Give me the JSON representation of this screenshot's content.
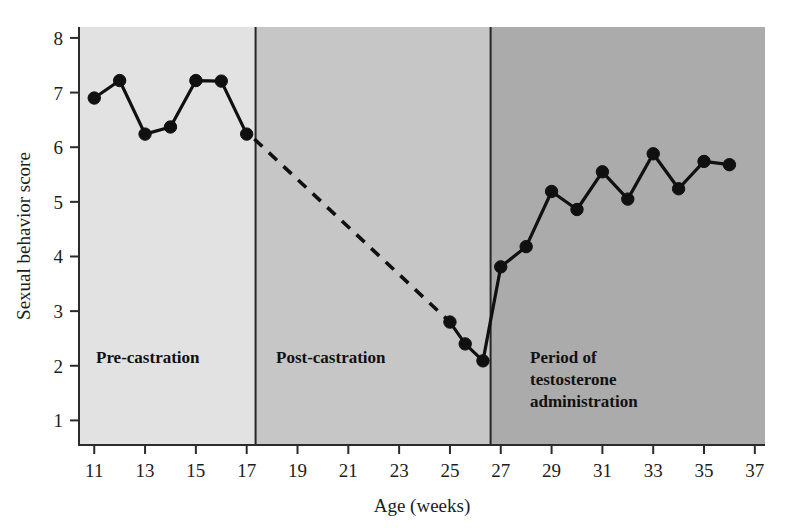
{
  "chart_data": {
    "type": "line",
    "title": "",
    "xlabel": "Age (weeks)",
    "ylabel": "Sexual behavior score",
    "xlim": [
      10.4,
      37.4
    ],
    "ylim": [
      0.55,
      8.2
    ],
    "xticks": [
      11,
      13,
      15,
      17,
      19,
      21,
      23,
      25,
      27,
      29,
      31,
      33,
      35,
      37
    ],
    "yticks": [
      1,
      2,
      3,
      4,
      5,
      6,
      7,
      8
    ],
    "grid": false,
    "legend": "none",
    "series": [
      {
        "name": "Pre-castration observations",
        "style": "solid-with-markers",
        "x": [
          11,
          12,
          13,
          14,
          15,
          16,
          17
        ],
        "values": [
          6.9,
          7.22,
          6.24,
          6.37,
          7.22,
          7.21,
          6.24
        ]
      },
      {
        "name": "Castration decline (interpolated)",
        "style": "dashed-no-markers",
        "x": [
          17.3,
          25
        ],
        "values": [
          6.15,
          2.8
        ]
      },
      {
        "name": "Post-castration observations",
        "style": "solid-with-markers",
        "x": [
          25,
          25.6,
          26.3
        ],
        "values": [
          2.8,
          2.4,
          2.09
        ]
      },
      {
        "name": "Testosterone administration observations",
        "style": "solid-with-markers",
        "x": [
          27,
          28,
          29,
          30,
          31,
          32,
          33,
          34,
          35,
          36
        ],
        "values": [
          3.81,
          4.18,
          5.19,
          4.86,
          5.55,
          5.05,
          5.88,
          5.24,
          5.74,
          5.68
        ]
      }
    ],
    "bands": [
      {
        "label": "Pre-castration",
        "x_start": 10.4,
        "x_end": 17.35,
        "color": "#e2e2e2",
        "label_lines": [
          "Pre-castration"
        ]
      },
      {
        "label": "Post-castration",
        "x_start": 17.35,
        "x_end": 26.6,
        "color": "#c6c6c6",
        "label_lines": [
          "Post-castration"
        ]
      },
      {
        "label": "Period of testosterone administration",
        "x_start": 26.6,
        "x_end": 37.4,
        "color": "#ababab",
        "label_lines": [
          "Period of",
          "testosterone",
          "administration"
        ]
      }
    ]
  },
  "axes": {
    "y_title": "Sexual behavior score",
    "x_title": "Age (weeks)",
    "y_tick_labels": [
      "8",
      "7",
      "6",
      "5",
      "4",
      "3",
      "2",
      "1"
    ],
    "x_tick_labels": [
      "11",
      "13",
      "15",
      "17",
      "19",
      "21",
      "23",
      "25",
      "27",
      "29",
      "31",
      "33",
      "35",
      "37"
    ]
  },
  "bands": {
    "pre": {
      "line1": "Pre-castration"
    },
    "post": {
      "line1": "Post-castration"
    },
    "testosterone": {
      "line1": "Period of",
      "line2": "testosterone",
      "line3": "administration"
    }
  },
  "colors": {
    "band_pre": "#e2e2e2",
    "band_post": "#c6c6c6",
    "band_testosterone": "#ababab",
    "line": "#101010",
    "axis": "#2b2b2b",
    "background": "#ffffff"
  }
}
